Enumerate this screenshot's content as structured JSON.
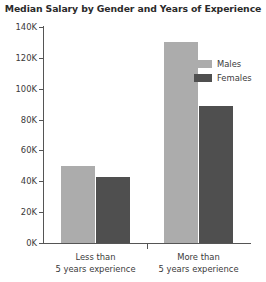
{
  "chart_data": {
    "type": "bar",
    "title": "Median Salary by Gender and Years of Experience",
    "xlabel": "",
    "ylabel": "",
    "categories": [
      "Less than\n5 years experience",
      "More than\n5 years experience"
    ],
    "category_lines": [
      [
        "Less than",
        "5 years experience"
      ],
      [
        "More than",
        "5 years experience"
      ]
    ],
    "series": [
      {
        "name": "Males",
        "color": "#acacac",
        "values": [
          50000,
          130000
        ]
      },
      {
        "name": "Females",
        "color": "#4f4f4f",
        "values": [
          43000,
          89000
        ]
      }
    ],
    "ylim": [
      0,
      140000
    ],
    "ytick_values": [
      0,
      20000,
      40000,
      60000,
      80000,
      100000,
      120000,
      140000
    ],
    "ytick_labels": [
      "0K",
      "20K",
      "40K",
      "60K",
      "80K",
      "100K",
      "120K",
      "140K"
    ],
    "grid": false,
    "legend_position": "upper right",
    "axis_color": "#555555"
  }
}
